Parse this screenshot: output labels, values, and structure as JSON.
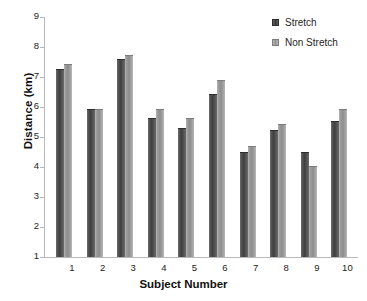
{
  "chart_data": {
    "type": "bar",
    "title": "",
    "xlabel": "Subject Number",
    "ylabel": "Distance (km)",
    "categories": [
      "1",
      "2",
      "3",
      "4",
      "5",
      "6",
      "7",
      "8",
      "9",
      "10"
    ],
    "series": [
      {
        "name": "Stretch",
        "color": "#4a4a4a",
        "values": [
          7.28,
          5.95,
          7.6,
          5.65,
          5.3,
          6.45,
          4.5,
          5.25,
          4.5,
          5.55
        ]
      },
      {
        "name": "Non Stretch",
        "color": "#a0a0a0",
        "values": [
          7.45,
          5.95,
          7.72,
          5.95,
          5.62,
          6.9,
          4.7,
          5.45,
          4.05,
          5.95
        ]
      }
    ],
    "ylim": [
      1,
      9
    ],
    "yticks": [
      "9",
      "8",
      "7",
      "6",
      "5",
      "4",
      "3",
      "2",
      "1"
    ],
    "ytick_values": [
      9,
      8,
      7,
      6,
      5,
      4,
      3,
      2,
      1
    ],
    "grid": false,
    "legend_position": "top-right"
  },
  "legend": {
    "items": [
      {
        "label": "Stretch"
      },
      {
        "label": "Non Stretch"
      }
    ]
  },
  "axes": {
    "y_title": "Distance (km)",
    "x_title": "Subject Number"
  }
}
